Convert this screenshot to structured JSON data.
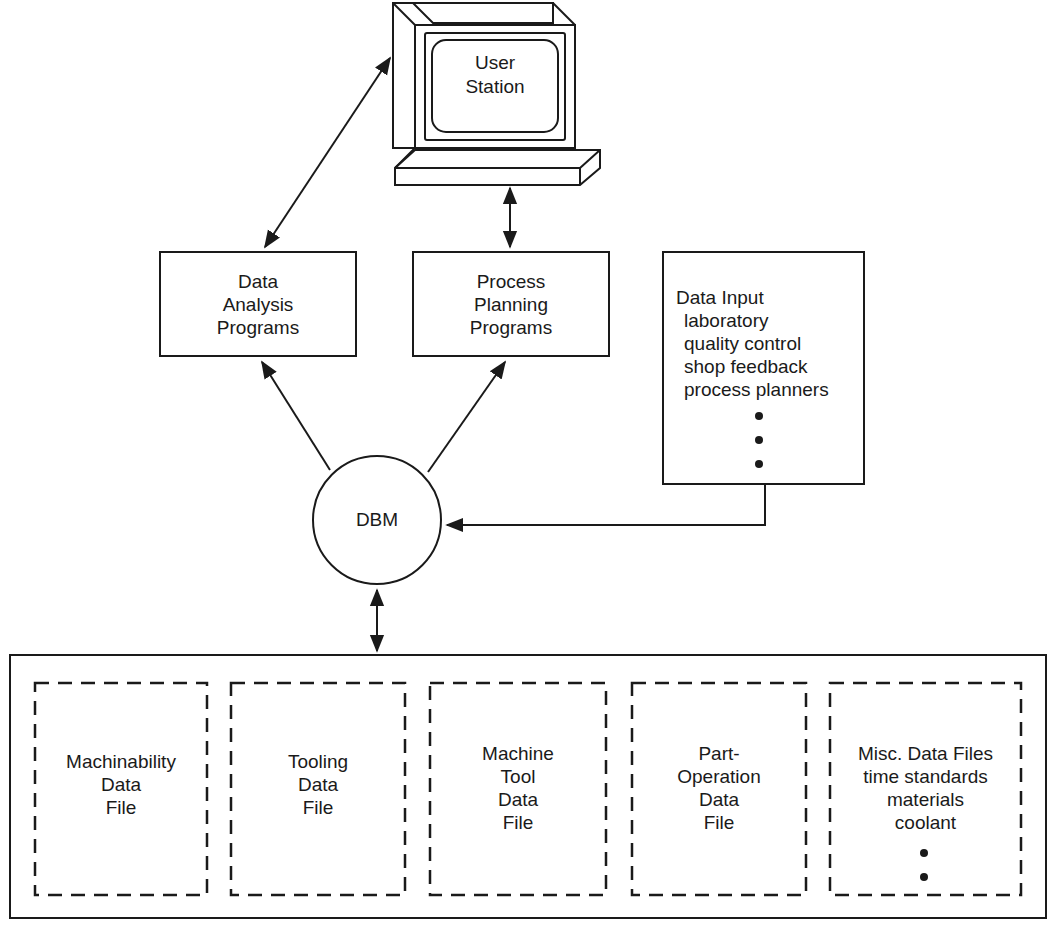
{
  "diagram": {
    "user_station": {
      "label_lines": [
        "User",
        "Station"
      ]
    },
    "data_analysis": {
      "label_lines": [
        "Data",
        "Analysis",
        "Programs"
      ]
    },
    "process_planning": {
      "label_lines": [
        "Process",
        "Planning",
        "Programs"
      ]
    },
    "data_input": {
      "title": "Data Input",
      "items": [
        "laboratory",
        "quality control",
        "shop feedback",
        "process planners"
      ]
    },
    "dbm": {
      "label": "DBM"
    },
    "files": [
      {
        "label_lines": [
          "Machinability",
          "Data",
          "File"
        ]
      },
      {
        "label_lines": [
          "Tooling",
          "Data",
          "File"
        ]
      },
      {
        "label_lines": [
          "Machine",
          "Tool",
          "Data",
          "File"
        ]
      },
      {
        "label_lines": [
          "Part-",
          "Operation",
          "Data",
          "File"
        ]
      },
      {
        "label_lines": [
          "Misc. Data Files",
          "time standards",
          "materials",
          "coolant"
        ]
      }
    ]
  }
}
